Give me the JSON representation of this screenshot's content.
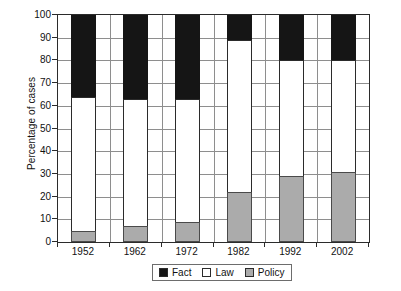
{
  "chart_data": {
    "type": "bar",
    "subtype": "stacked-100-percent",
    "title": "",
    "xlabel": "",
    "ylabel": "Percentage of cases",
    "ylim": [
      0,
      100
    ],
    "ytick_step": 10,
    "yticks": [
      0,
      10,
      20,
      30,
      40,
      50,
      60,
      70,
      80,
      90,
      100
    ],
    "ytick_labels": [
      "0",
      "10",
      "20",
      "30",
      "40",
      "50",
      "60",
      "70",
      "80",
      "90",
      "100"
    ],
    "grid": true,
    "grid_axis": "both",
    "legend_position": "bottom-center",
    "legend_entries": [
      "Fact",
      "Law",
      "Policy"
    ],
    "categories": [
      "1952",
      "1962",
      "1972",
      "1982",
      "1992",
      "2002"
    ],
    "series": [
      {
        "name": "Policy",
        "color": "#ababab",
        "values": [
          5,
          7,
          9,
          22,
          29,
          31
        ]
      },
      {
        "name": "Law",
        "color": "#ffffff",
        "values": [
          59,
          56,
          54,
          67,
          51,
          49
        ]
      },
      {
        "name": "Fact",
        "color": "#151515",
        "values": [
          36,
          37,
          37,
          11,
          20,
          20
        ]
      }
    ],
    "cumulative_tops": {
      "policy": [
        5,
        7,
        9,
        22,
        29,
        31
      ],
      "law": [
        64,
        63,
        63,
        89,
        80,
        80
      ],
      "fact": [
        100,
        100,
        100,
        100,
        100,
        100
      ]
    }
  },
  "colors": {
    "fact": "#151515",
    "law": "#ffffff",
    "policy": "#ababab",
    "axis": "#2b2b2b",
    "grid": "#8e8e8e",
    "background": "#ffffff"
  }
}
